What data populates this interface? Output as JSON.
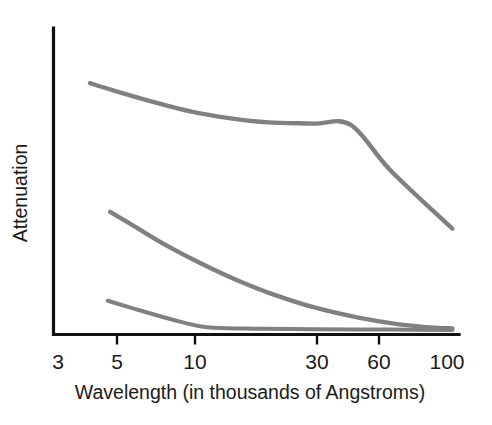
{
  "chart_data": {
    "type": "line",
    "title": "",
    "subtitle": "",
    "xlabel": "Wavelength (in thousands of Angstroms)",
    "ylabel": "Attenuation",
    "grid": false,
    "legend": "none",
    "xscale": "log",
    "xlim": [
      3,
      110
    ],
    "ylim": [
      0,
      1
    ],
    "xticks": [
      {
        "label": "3",
        "value": 3,
        "px": 58,
        "tick_mark": false
      },
      {
        "label": "5",
        "value": 5,
        "px": 117,
        "tick_mark": true
      },
      {
        "label": "10",
        "value": 10,
        "px": 195,
        "tick_mark": true
      },
      {
        "label": "30",
        "value": 30,
        "px": 317,
        "tick_mark": true
      },
      {
        "label": "60",
        "value": 60,
        "px": 379,
        "tick_mark": true
      },
      {
        "label": "100",
        "value": 100,
        "px": 447,
        "tick_mark": false
      }
    ],
    "yticks": [],
    "series": [
      {
        "name": "upper-curve",
        "color": "#808080",
        "stroke_width": 4.4,
        "points": [
          {
            "x": 4.0,
            "y": 0.82
          },
          {
            "x": 5.0,
            "y": 0.795
          },
          {
            "x": 7.0,
            "y": 0.76
          },
          {
            "x": 10.0,
            "y": 0.727
          },
          {
            "x": 14.0,
            "y": 0.706
          },
          {
            "x": 20.0,
            "y": 0.692
          },
          {
            "x": 30.0,
            "y": 0.688
          },
          {
            "x": 42.0,
            "y": 0.684
          },
          {
            "x": 60.0,
            "y": 0.536
          },
          {
            "x": 105.0,
            "y": 0.345
          }
        ]
      },
      {
        "name": "middle-curve",
        "color": "#808080",
        "stroke_width": 4.4,
        "points": [
          {
            "x": 4.8,
            "y": 0.4
          },
          {
            "x": 6.0,
            "y": 0.352
          },
          {
            "x": 8.0,
            "y": 0.29
          },
          {
            "x": 11.0,
            "y": 0.23
          },
          {
            "x": 15.0,
            "y": 0.178
          },
          {
            "x": 21.0,
            "y": 0.13
          },
          {
            "x": 30.0,
            "y": 0.089
          },
          {
            "x": 45.0,
            "y": 0.055
          },
          {
            "x": 65.0,
            "y": 0.033
          },
          {
            "x": 90.0,
            "y": 0.022
          },
          {
            "x": 105.0,
            "y": 0.02
          }
        ]
      },
      {
        "name": "lower-curve",
        "color": "#808080",
        "stroke_width": 4.0,
        "points": [
          {
            "x": 4.7,
            "y": 0.11
          },
          {
            "x": 6.5,
            "y": 0.075
          },
          {
            "x": 9.0,
            "y": 0.042
          },
          {
            "x": 11.5,
            "y": 0.024
          },
          {
            "x": 18.0,
            "y": 0.019
          },
          {
            "x": 30.0,
            "y": 0.017
          },
          {
            "x": 60.0,
            "y": 0.016
          },
          {
            "x": 105.0,
            "y": 0.015
          }
        ]
      }
    ]
  }
}
